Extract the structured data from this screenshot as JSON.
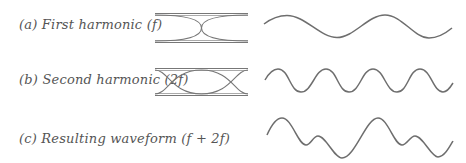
{
  "figure": {
    "rows": [
      {
        "id": "a",
        "label": "(a) First harmonic (f)",
        "harmonic": 1
      },
      {
        "id": "b",
        "label": "(b) Second harmonic (2f)",
        "harmonic": 2
      },
      {
        "id": "c",
        "label": "(c) Resulting waveform (f + 2f)",
        "harmonic": "1+2"
      }
    ],
    "colors": {
      "line": "#6e6e6e",
      "text": "#555555",
      "tube": "#8a8a8a"
    }
  }
}
